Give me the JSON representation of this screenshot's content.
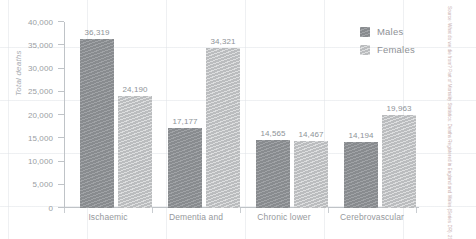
{
  "chart_data": {
    "type": "bar",
    "title": "",
    "subtitle": "",
    "xlabel": "",
    "ylabel": "Total deaths",
    "ylim": [
      0,
      40000
    ],
    "ytick_values": [
      0,
      5000,
      10000,
      15000,
      20000,
      25000,
      30000,
      35000,
      40000
    ],
    "ytick_labels": [
      "0",
      "5,000",
      "10,000",
      "15,000",
      "20,000",
      "25,000",
      "30,000",
      "35,000",
      "40,000"
    ],
    "categories": [
      "Ischaemic",
      "Dementia and",
      "Chronic lower",
      "Cerebrovascular"
    ],
    "series": [
      {
        "name": "Males",
        "color": "#8f9296",
        "values": [
          36319,
          17177,
          14565,
          14194
        ],
        "value_labels": [
          "36,319",
          "17,177",
          "14,565",
          "14,194"
        ]
      },
      {
        "name": "Females",
        "color": "#c2c4c6",
        "values": [
          24190,
          34321,
          14467,
          19963
        ],
        "value_labels": [
          "24,190",
          "34,321",
          "14,467",
          "19,963"
        ]
      }
    ],
    "grid": false,
    "legend_position": "right-top",
    "value_labels_shown": true
  },
  "legend": {
    "items": [
      {
        "label": "Males"
      },
      {
        "label": "Females"
      }
    ]
  },
  "axes": {
    "y_title": "Total deaths"
  },
  "source": {
    "text": "Source: What do we die from? Part of Mortality Statistics: Deaths Registered in England and Wales (Series DR), 2014 Released 17 December 2015"
  },
  "colors": {
    "males": "#8f9296",
    "females": "#c2c4c6",
    "axis": "#bfc3c7",
    "text": "#96999d",
    "background": "#ffffff"
  }
}
